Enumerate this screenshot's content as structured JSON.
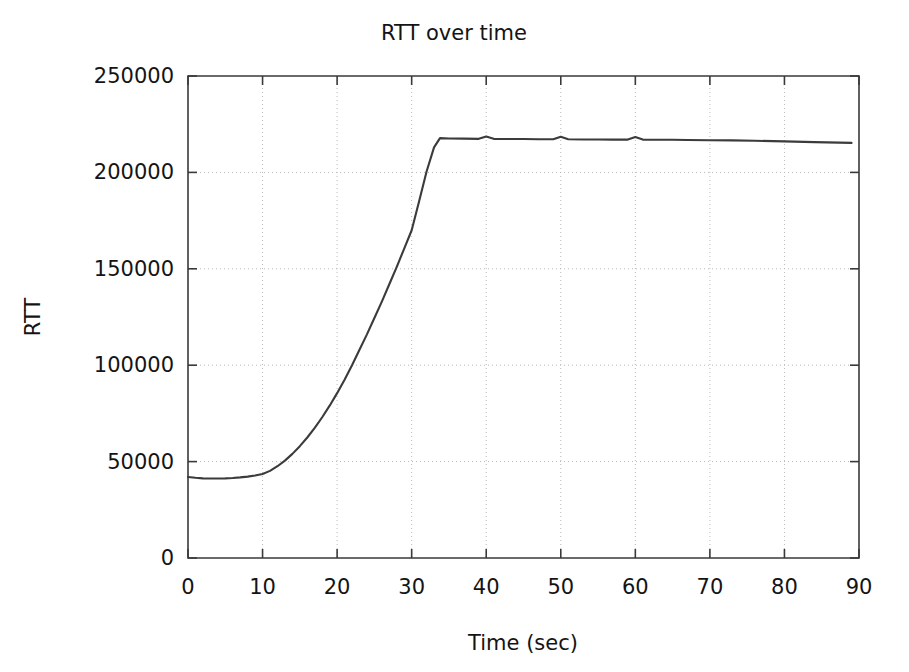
{
  "chart_data": {
    "type": "line",
    "title": "RTT over time",
    "xlabel": "Time (sec)",
    "ylabel": "RTT",
    "xlim": [
      0,
      90
    ],
    "ylim": [
      0,
      250000
    ],
    "xticks": [
      0,
      10,
      20,
      30,
      40,
      50,
      60,
      70,
      80,
      90
    ],
    "xticklabels": [
      "0",
      "10",
      "20",
      "30",
      "40",
      "50",
      "60",
      "70",
      "80",
      "90"
    ],
    "yticks": [
      0,
      50000,
      100000,
      150000,
      200000,
      250000
    ],
    "yticklabels": [
      "0",
      "50000",
      "100000",
      "150000",
      "200000",
      "250000"
    ],
    "grid": true,
    "grid_style": "dotted",
    "legend": null,
    "line_color": "#3b3b3b",
    "series": [
      {
        "name": "RTT",
        "x": [
          0,
          1,
          2,
          3,
          4,
          5,
          6,
          7,
          8,
          9,
          10,
          11,
          12,
          13,
          14,
          15,
          16,
          17,
          18,
          19,
          20,
          21,
          22,
          23,
          24,
          25,
          26,
          27,
          28,
          29,
          30,
          31,
          32,
          33,
          33.8,
          35,
          37,
          39,
          40,
          41,
          43,
          45,
          47,
          49,
          50,
          51,
          53,
          55,
          57,
          59,
          60,
          61,
          63,
          65,
          67,
          70,
          73,
          76,
          80,
          84,
          89
        ],
        "y": [
          42000,
          41600,
          41300,
          41200,
          41200,
          41300,
          41500,
          41800,
          42200,
          42800,
          43600,
          45200,
          47600,
          50500,
          54000,
          58000,
          62500,
          67500,
          73000,
          79000,
          85500,
          92500,
          100000,
          108000,
          116000,
          124500,
          133000,
          142000,
          151000,
          160500,
          170000,
          185000,
          200500,
          213000,
          217800,
          217600,
          217500,
          217400,
          218600,
          217400,
          217300,
          217300,
          217200,
          217200,
          218500,
          217200,
          217100,
          217100,
          217000,
          217000,
          218300,
          217000,
          216900,
          216900,
          216800,
          216700,
          216600,
          216400,
          216100,
          215700,
          215300
        ]
      }
    ]
  },
  "figure": {
    "background_color": "#ffffff",
    "plot_area": {
      "left": 188,
      "top": 76,
      "right": 859,
      "bottom": 558
    }
  }
}
